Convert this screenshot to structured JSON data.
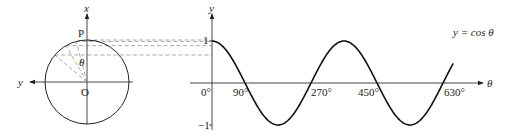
{
  "circle_diagram": {
    "x_axis_label": "x",
    "y_axis_label": "y",
    "point_label": "P",
    "origin_label": "O",
    "angle_label": "θ",
    "radius_angles_deg": [
      15,
      30,
      50
    ]
  },
  "graph": {
    "y_axis_label": "y",
    "x_axis_label": "θ",
    "curve_label": "y = cos θ",
    "y_tick_labels": [
      "1",
      "−1"
    ],
    "x_tick_labels": [
      "0°",
      "90°",
      "270°",
      "450°",
      "630°"
    ]
  },
  "chart_data": {
    "type": "line",
    "title": "",
    "xlabel": "θ",
    "ylabel": "y",
    "series": [
      {
        "name": "y = cos θ",
        "function": "cos",
        "x_range_deg": [
          0,
          720
        ]
      }
    ],
    "x_ticks_deg": [
      0,
      90,
      270,
      450,
      630
    ],
    "y_ticks": [
      1,
      -1
    ],
    "ylim": [
      -1,
      1
    ]
  }
}
